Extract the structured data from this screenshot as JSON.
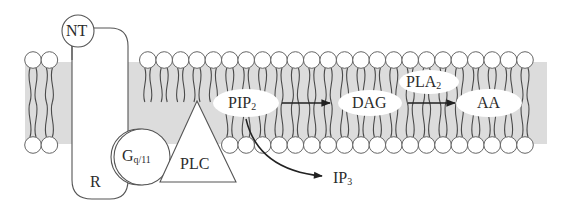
{
  "diagram": {
    "type": "phospholipase signaling pathway in lipid bilayer",
    "colors": {
      "background": "#ffffff",
      "membrane_core": "#dcdcdc",
      "stroke": "#555555",
      "text": "#2b2b2b",
      "arrow": "#222222"
    },
    "labels": {
      "nt": "NT",
      "receptor": "R",
      "g_protein": {
        "base": "G",
        "sub": "q/11"
      },
      "plc": "PLC",
      "pip2": {
        "base": "PIP",
        "sub": "2"
      },
      "dag": "DAG",
      "pla2": {
        "base": "PLA",
        "sub": "2"
      },
      "aa": "AA",
      "ip3": {
        "base": "IP",
        "sub": "3"
      }
    },
    "edges": [
      {
        "from": "PIP2",
        "to": "DAG",
        "style": "straight arrow"
      },
      {
        "from": "DAG",
        "to": "AA",
        "style": "straight arrow",
        "enzyme": "PLA2"
      },
      {
        "from": "PIP2",
        "to": "IP3",
        "style": "curved arrow"
      }
    ]
  }
}
